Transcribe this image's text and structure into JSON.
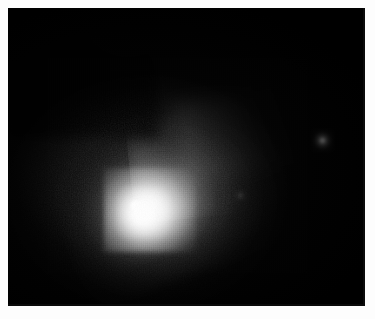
{
  "page": {
    "background_color": "#fdfdfd",
    "width": 375,
    "height": 319,
    "caption": ""
  },
  "image_frame": {
    "name": "comet-ccd-frame",
    "background_color": "#000000",
    "left": 8,
    "top": 8,
    "width": 357,
    "height": 298,
    "border_color": "#0a0a0a"
  },
  "subject": {
    "type": "comet",
    "description": "Grayscale CCD astronomical image of a comet showing a bright stellar central condensation, a diffuse elongated coma, and a broad faint dust fan extending toward the upper right.",
    "colormap": "grayscale",
    "nucleus": {
      "label": "central-condensation",
      "x": 135,
      "y": 205,
      "peak_color": "#ffffff",
      "peak_value": 255
    },
    "coma": {
      "label": "coma",
      "center_x": 140,
      "center_y": 196,
      "semi_major_px": 95,
      "semi_minor_px": 72,
      "position_angle_deg": -20,
      "bright_color": "#e6e6e6",
      "mid_color": "#787878",
      "faint_color": "#2a2a2a"
    },
    "tail": {
      "label": "dust-fan",
      "direction": "upper-right",
      "origin_x": 140,
      "origin_y": 196,
      "extent_x": 262,
      "extent_y": 96,
      "position_angle_deg": 66,
      "color": "#4a4a4a"
    },
    "field_objects": [
      {
        "label": "faint-field-star",
        "x": 322,
        "y": 140,
        "brightness": "faint",
        "color": "#767676"
      },
      {
        "label": "faint-speck",
        "x": 240,
        "y": 195,
        "brightness": "very-faint",
        "color": "#343434"
      }
    ],
    "noise": {
      "label": "ccd-pixel-noise",
      "visible": true,
      "character": "blocky readout grain across the coma"
    }
  },
  "chart_data": {
    "type": "heatmap",
    "title": "",
    "xlabel": "",
    "ylabel": "",
    "colormap": "grayscale",
    "value_range": [
      0,
      255
    ],
    "key_points": [
      {
        "name": "nucleus peak",
        "x": 135,
        "y": 205,
        "value": 255
      },
      {
        "name": "inner coma",
        "x": 140,
        "y": 196,
        "value": 190
      },
      {
        "name": "mid coma NE",
        "x": 165,
        "y": 170,
        "value": 120
      },
      {
        "name": "mid coma NW",
        "x": 110,
        "y": 160,
        "value": 95
      },
      {
        "name": "outer coma W",
        "x": 92,
        "y": 190,
        "value": 55
      },
      {
        "name": "outer coma S",
        "x": 140,
        "y": 250,
        "value": 40
      },
      {
        "name": "dust fan inner",
        "x": 200,
        "y": 150,
        "value": 48
      },
      {
        "name": "dust fan mid",
        "x": 235,
        "y": 125,
        "value": 26
      },
      {
        "name": "dust fan outer",
        "x": 262,
        "y": 104,
        "value": 12
      },
      {
        "name": "faint field star",
        "x": 322,
        "y": 140,
        "value": 70
      },
      {
        "name": "sky background",
        "x": 40,
        "y": 40,
        "value": 3
      }
    ]
  }
}
